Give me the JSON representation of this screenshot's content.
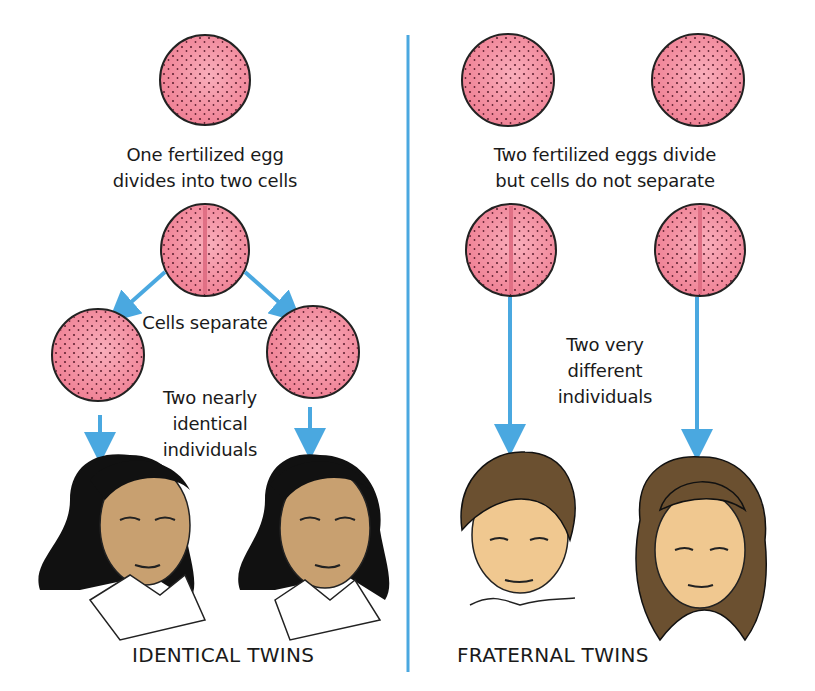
{
  "left_panel": {
    "heading": "One fertilized egg divides into two cells",
    "caption_line1": "One fertilized egg",
    "caption_line2": "divides into two cells",
    "separate_label": "Cells separate",
    "result_line1": "Two nearly",
    "result_line2": "identical",
    "result_line3": "individuals",
    "title": "IDENTICAL TWINS"
  },
  "right_panel": {
    "caption_line1": "Two fertilized eggs divide",
    "caption_line2": "but cells do not separate",
    "result_line1": "Two very",
    "result_line2": "different",
    "result_line3": "individuals",
    "title": "FRATERNAL TWINS"
  },
  "colors": {
    "cell_fill": "#f28a9c",
    "cell_center": "#f7a6b4",
    "arrow": "#4aa8e0",
    "divider": "#4aa8e0",
    "skin": "#c8a070",
    "skin_light": "#f0c890",
    "hair_black": "#111111",
    "hair_brown": "#6b5030"
  }
}
